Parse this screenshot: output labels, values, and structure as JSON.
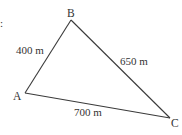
{
  "diagram": {
    "type": "triangle",
    "edge_mark": ":",
    "vertices": {
      "A": {
        "label": "A"
      },
      "B": {
        "label": "B"
      },
      "C": {
        "label": "C"
      }
    },
    "sides": {
      "AB": {
        "label": "400 m",
        "length_m": 400
      },
      "BC": {
        "label": "650 m",
        "length_m": 650
      },
      "AC": {
        "label": "700 m",
        "length_m": 700
      }
    },
    "colors": {
      "line": "#3a3a3a",
      "text": "#333333"
    }
  }
}
